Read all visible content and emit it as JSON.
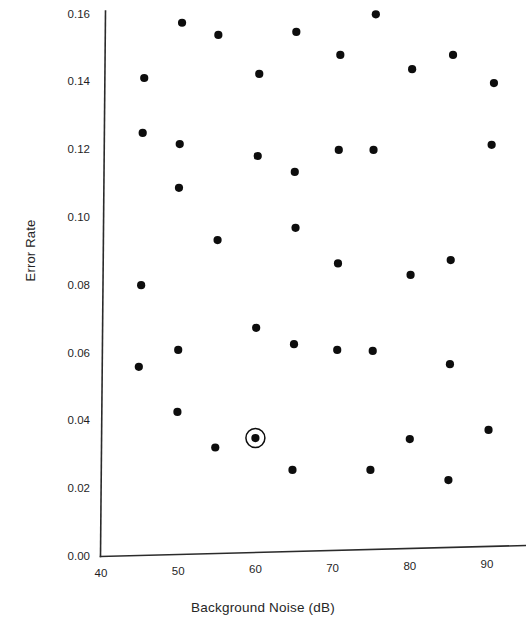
{
  "chart_data": {
    "type": "scatter",
    "title": "",
    "xlabel": "Background Noise (dB)",
    "ylabel": "Error Rate",
    "xlim": [
      40,
      95
    ],
    "ylim": [
      0.0,
      0.16
    ],
    "xticks": [
      "40",
      "50",
      "60",
      "70",
      "80",
      "90"
    ],
    "xtick_values": [
      40,
      50,
      60,
      70,
      80,
      90
    ],
    "yticks": [
      "0.00",
      "0.02",
      "0.04",
      "0.06",
      "0.08",
      "0.10",
      "0.12",
      "0.14",
      "0.16"
    ],
    "ytick_values": [
      0.0,
      0.02,
      0.04,
      0.06,
      0.08,
      0.1,
      0.12,
      0.14,
      0.16
    ],
    "grid": false,
    "legend": null,
    "marker": "filled-circle",
    "marker_color": "#0d0d0d",
    "points": [
      {
        "x": 50.5,
        "y": 0.1573
      },
      {
        "x": 55.2,
        "y": 0.1537
      },
      {
        "x": 65.3,
        "y": 0.1546
      },
      {
        "x": 75.6,
        "y": 0.1598
      },
      {
        "x": 45.6,
        "y": 0.141
      },
      {
        "x": 60.5,
        "y": 0.1422
      },
      {
        "x": 71.0,
        "y": 0.1478
      },
      {
        "x": 80.3,
        "y": 0.1436
      },
      {
        "x": 85.6,
        "y": 0.1478
      },
      {
        "x": 90.9,
        "y": 0.1395
      },
      {
        "x": 45.4,
        "y": 0.1248
      },
      {
        "x": 50.2,
        "y": 0.1215
      },
      {
        "x": 60.3,
        "y": 0.118
      },
      {
        "x": 70.8,
        "y": 0.1198
      },
      {
        "x": 75.3,
        "y": 0.1198
      },
      {
        "x": 90.6,
        "y": 0.1213
      },
      {
        "x": 65.1,
        "y": 0.1133
      },
      {
        "x": 50.1,
        "y": 0.1086
      },
      {
        "x": 65.2,
        "y": 0.0968
      },
      {
        "x": 55.1,
        "y": 0.0932
      },
      {
        "x": 70.7,
        "y": 0.0863
      },
      {
        "x": 85.3,
        "y": 0.0873
      },
      {
        "x": 80.1,
        "y": 0.0829
      },
      {
        "x": 45.2,
        "y": 0.0799
      },
      {
        "x": 60.1,
        "y": 0.0673
      },
      {
        "x": 65.0,
        "y": 0.0625
      },
      {
        "x": 50.0,
        "y": 0.0608
      },
      {
        "x": 70.6,
        "y": 0.0608
      },
      {
        "x": 75.2,
        "y": 0.0605
      },
      {
        "x": 85.2,
        "y": 0.0566
      },
      {
        "x": 44.9,
        "y": 0.0558
      },
      {
        "x": 49.9,
        "y": 0.0425
      },
      {
        "x": 60.0,
        "y": 0.0348
      },
      {
        "x": 80.0,
        "y": 0.0345
      },
      {
        "x": 54.8,
        "y": 0.032
      },
      {
        "x": 90.2,
        "y": 0.0372
      },
      {
        "x": 64.8,
        "y": 0.0254
      },
      {
        "x": 74.9,
        "y": 0.0254
      },
      {
        "x": 85.0,
        "y": 0.0224
      }
    ],
    "highlighted_point": {
      "x": 60.0,
      "y": 0.0348,
      "annotation": "circled-marker"
    }
  },
  "axis": {
    "x_axis_name": "x-axis",
    "y_axis_name": "y-axis"
  }
}
